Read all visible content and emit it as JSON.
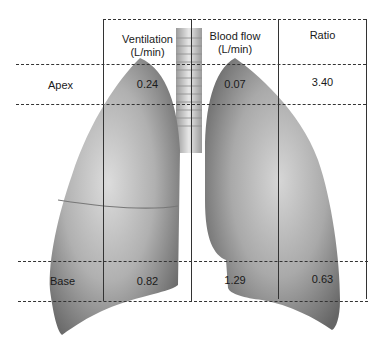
{
  "figure": {
    "type": "lung ventilation-perfusion diagram",
    "columns": [
      "Ventilation (L/min)",
      "Blood flow (L/min)",
      "Ratio"
    ],
    "header": {
      "ventilation_line1": "Ventilation",
      "ventilation_line2": "(L/min)",
      "bloodflow_line1": "Blood flow",
      "bloodflow_line2": "(L/min)",
      "ratio": "Ratio"
    },
    "rows": [
      {
        "label": "Apex",
        "ventilation": "0.24",
        "blood_flow": "0.07",
        "ratio": "3.40"
      },
      {
        "label": "Base",
        "ventilation": "0.82",
        "blood_flow": "1.29",
        "ratio": "0.63"
      }
    ]
  },
  "colors": {
    "line": "#333333",
    "lung_light": "#d9d9d9",
    "lung_mid": "#a8a8a8",
    "lung_dark": "#6e6e6e"
  }
}
